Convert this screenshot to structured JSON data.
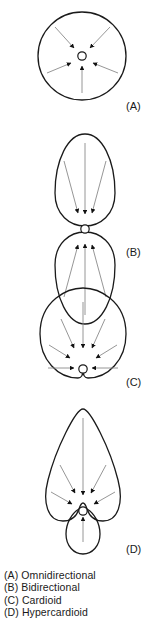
{
  "figure": {
    "background_color": "#ffffff",
    "outline_color": "#1a1a1a",
    "arrow_line_color": "#8a8a8a",
    "arrow_head_color": "#111111",
    "capsule_color": "#ffffff"
  },
  "panels": [
    {
      "id": "A",
      "label": "(A)",
      "pattern": "Omnidirectional",
      "shape": "circle",
      "arrow_count": 5,
      "arrow_directions": [
        "upper-left",
        "upper-right",
        "lower-left",
        "lower-right",
        "bottom"
      ]
    },
    {
      "id": "B",
      "label": "(B)",
      "pattern": "Bidirectional",
      "shape": "figure-eight",
      "arrow_count": 6,
      "arrow_directions": [
        "top-left",
        "top-center",
        "top-right",
        "bottom-left",
        "bottom-center",
        "bottom-right"
      ]
    },
    {
      "id": "C",
      "label": "(C)",
      "pattern": "Cardioid",
      "shape": "heart",
      "arrow_count": 7,
      "arrow_directions": [
        "top-center",
        "upper-left",
        "upper-right",
        "mid-left",
        "mid-right",
        "lower-left",
        "lower-right"
      ]
    },
    {
      "id": "D",
      "label": "(D)",
      "pattern": "Hypercardioid",
      "shape": "teardrop-with-rear-lobe",
      "arrow_count": 6,
      "arrow_directions": [
        "top-center",
        "upper-left",
        "upper-right",
        "lower-left",
        "lower-right",
        "rear-lobe-bottom"
      ]
    }
  ],
  "caption": {
    "lines": [
      "(A) Omnidirectional",
      "(B) Bidirectional",
      "(C) Cardioid",
      "(D) Hypercardioid"
    ],
    "line_a": "(A) Omnidirectional",
    "line_b": "(B) Bidirectional",
    "line_c": "(C) Cardioid",
    "line_d": "(D) Hypercardioid"
  }
}
